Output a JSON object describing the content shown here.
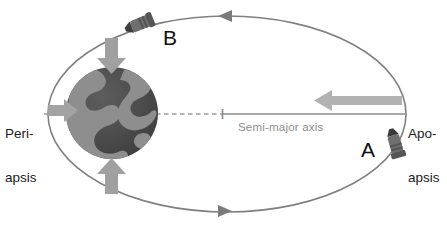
{
  "diagram": {
    "labels": {
      "periapsis_line1": "Peri-",
      "periapsis_line2": "apsis",
      "apoapsis_line1": "Apo-",
      "apoapsis_line2": "apsis",
      "semi_major_axis": "Semi-major axis",
      "spacecraft_a": "A",
      "spacecraft_b": "B"
    },
    "colors": {
      "background": "#ffffff",
      "orbit_stroke": "#7f7f7f",
      "axis_line": "#8d8d8d",
      "dashed_line": "#9a9a9a",
      "gravity_arrow": "#9e9e9e",
      "velocity_arrow": "#b0b0b0",
      "planet_ocean": "#4a4a4a",
      "planet_land": "#8c8c8c",
      "spacecraft_body": "#6d6d6d",
      "spacecraft_dark": "#3a3a3a",
      "text_dark": "#1b1b1b",
      "text_gray": "#8d8d8d"
    },
    "geometry": {
      "ellipse_center_x": 227,
      "ellipse_center_y": 114,
      "ellipse_rx": 179,
      "ellipse_ry": 98,
      "planet_center_x": 112,
      "planet_center_y": 113,
      "planet_radius": 46,
      "semi_major_axis_start_x": 222,
      "semi_major_axis_end_x": 406,
      "axis_y": 114
    },
    "elements": {
      "orbit_direction_top": "arrow-left",
      "orbit_direction_bottom": "arrow-right",
      "gravity_arrow_top": "arrow-down",
      "gravity_arrow_bottom": "arrow-up",
      "gravity_arrow_left": "arrow-right",
      "velocity_arrow_apoapsis": "arrow-left"
    }
  }
}
